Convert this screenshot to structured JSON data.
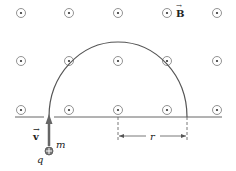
{
  "diagram": {
    "type": "physics-magnetic-field-circular-motion",
    "field_label": "B",
    "field_direction": "out-of-page",
    "velocity_label": "v",
    "mass_label": "m",
    "charge_label": "q",
    "charge_sign": "+",
    "radius_label": "r",
    "field_grid": {
      "columns_x": [
        21,
        69,
        118,
        167,
        217
      ],
      "rows_y": [
        13,
        61,
        110
      ]
    },
    "path": "semicircle",
    "colors": {
      "line": "#555555",
      "arrow": "#666666",
      "text": "#222222"
    }
  }
}
